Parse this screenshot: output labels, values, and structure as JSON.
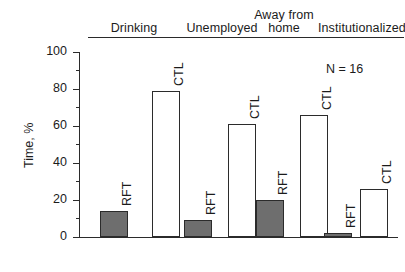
{
  "chart_data": {
    "type": "bar",
    "title": "",
    "xlabel": "",
    "ylabel": "Time, %",
    "ylim": [
      0,
      100
    ],
    "grid": false,
    "legend_position": "none",
    "annotation": "N = 16",
    "categories": [
      "Drinking",
      "Unemployed",
      "Away from home",
      "Institutionalized"
    ],
    "series": [
      {
        "name": "RFT",
        "values": [
          14,
          9,
          20,
          2
        ]
      },
      {
        "name": "CTL",
        "values": [
          79,
          61,
          66,
          26
        ]
      }
    ],
    "y_ticks_major": [
      "0",
      "20",
      "40",
      "60",
      "80",
      "100"
    ],
    "y_ticks_minor": [
      10,
      30,
      50,
      70,
      90
    ],
    "colors": {
      "rft_fill": "#6e6e6e",
      "ctl_fill": "#ffffff",
      "stroke": "#2b2b2b",
      "text": "#1b1b1b"
    }
  },
  "axis": {
    "y_title": "Time, %",
    "ticks": [
      {
        "value": "100"
      },
      {
        "value": "80"
      },
      {
        "value": "60"
      },
      {
        "value": "40"
      },
      {
        "value": "20"
      },
      {
        "value": "0"
      }
    ]
  },
  "headers": [
    {
      "lines": [
        "Drinking"
      ]
    },
    {
      "lines": [
        "Unemployed"
      ]
    },
    {
      "lines": [
        "Away from",
        "home"
      ]
    },
    {
      "lines": [
        "Institutionalized"
      ]
    }
  ],
  "bars": [
    {
      "group": "Drinking",
      "series": "RFT",
      "label": "RFT",
      "value": 14
    },
    {
      "group": "Drinking",
      "series": "CTL",
      "label": "CTL",
      "value": 79
    },
    {
      "group": "Unemployed",
      "series": "RFT",
      "label": "RFT",
      "value": 9
    },
    {
      "group": "Unemployed",
      "series": "CTL",
      "label": "CTL",
      "value": 61
    },
    {
      "group": "Away from home",
      "series": "RFT",
      "label": "RFT",
      "value": 20
    },
    {
      "group": "Away from home",
      "series": "CTL",
      "label": "CTL",
      "value": 66
    },
    {
      "group": "Institutionalized",
      "series": "RFT",
      "label": "RFT",
      "value": 2
    },
    {
      "group": "Institutionalized",
      "series": "CTL",
      "label": "CTL",
      "value": 26
    }
  ],
  "annotation": {
    "text": "N = 16"
  }
}
